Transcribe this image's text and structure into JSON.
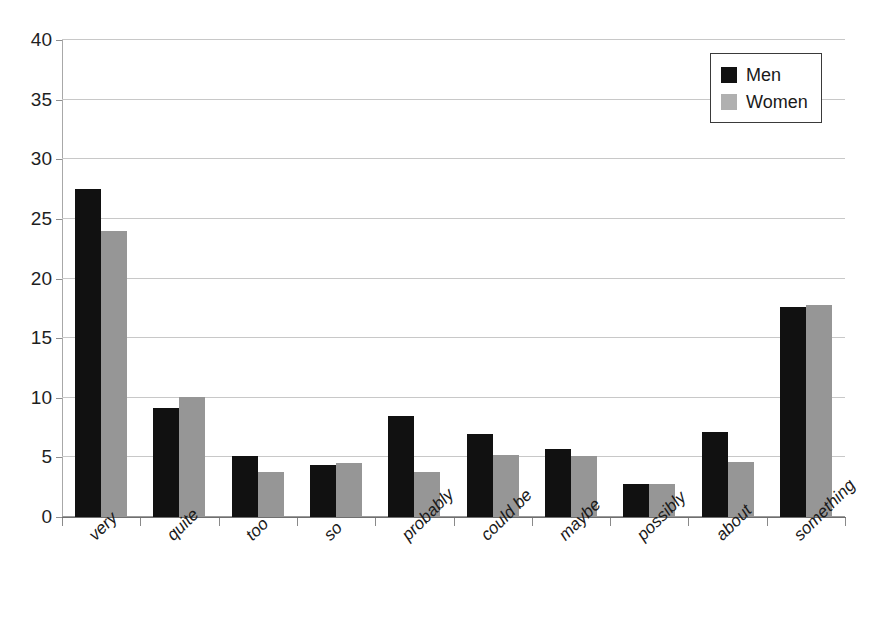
{
  "chart_data": {
    "type": "bar",
    "title": "",
    "xlabel": "",
    "ylabel": "",
    "ylim": [
      0,
      40
    ],
    "ytick_step": 5,
    "yticks": [
      0,
      5,
      10,
      15,
      20,
      25,
      30,
      35,
      40
    ],
    "grid": true,
    "legend_position": "top-right",
    "categories": [
      "very",
      "quite",
      "too",
      "so",
      "probably",
      "could be",
      "maybe",
      "possibly",
      "about",
      "something"
    ],
    "series": [
      {
        "name": "Men",
        "color": "#111111",
        "values": [
          27.5,
          9.1,
          5.1,
          4.4,
          8.5,
          7.0,
          5.7,
          2.8,
          7.1,
          17.6
        ]
      },
      {
        "name": "Women",
        "color": "#969696",
        "values": [
          24.0,
          10.1,
          3.8,
          4.5,
          3.8,
          5.2,
          5.1,
          2.8,
          4.6,
          17.8
        ]
      }
    ]
  },
  "legend": {
    "entries": [
      {
        "label": "Men",
        "swatch": "men"
      },
      {
        "label": "Women",
        "swatch": "women"
      }
    ]
  },
  "colors": {
    "men": "#111111",
    "women": "#969696",
    "gridline": "#c8c8c8",
    "axis": "#8a8a8a",
    "text": "#1a1a1a",
    "background": "#ffffff"
  }
}
